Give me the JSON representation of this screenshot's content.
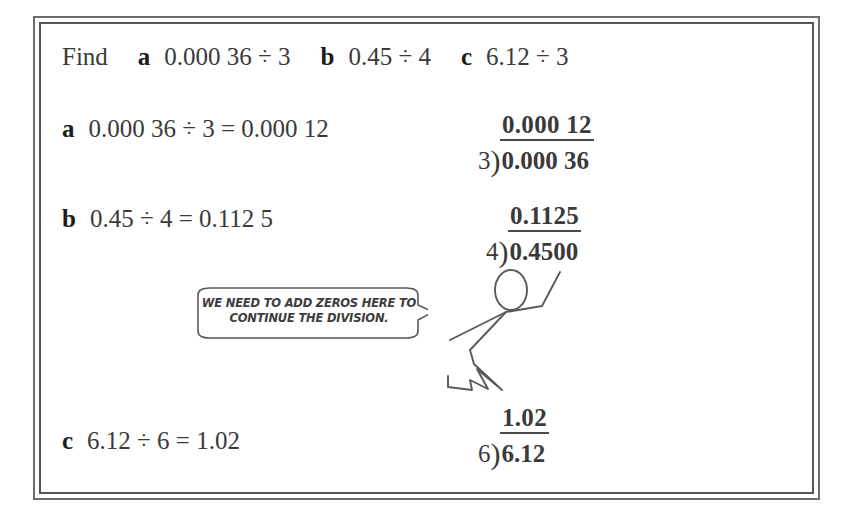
{
  "worksheet": {
    "prompt_label": "Find",
    "questions": [
      {
        "letter": "a",
        "expression": "0.000 36 ÷ 3"
      },
      {
        "letter": "b",
        "expression": "0.45 ÷ 4"
      },
      {
        "letter": "c",
        "expression": "6.12 ÷ 3"
      }
    ],
    "answers": [
      {
        "letter": "a",
        "statement": "0.000 36 ÷ 3 = 0.000 12"
      },
      {
        "letter": "b",
        "statement": "0.45 ÷ 4 = 0.112 5"
      },
      {
        "letter": "c",
        "statement": "6.12 ÷ 6 = 1.02"
      }
    ],
    "long_divisions": [
      {
        "key": "a",
        "quotient": "0.000 12",
        "divisor": "3",
        "dividend": "0.000 36"
      },
      {
        "key": "b",
        "quotient": "0.1125",
        "divisor": "4",
        "dividend": "0.4500"
      },
      {
        "key": "c",
        "quotient": "1.02",
        "divisor": "6",
        "dividend": "6.12"
      }
    ],
    "speech_bubble": {
      "line1": "WE NEED TO ADD ZEROS HERE TO",
      "line2": "CONTINUE THE DIVISION."
    },
    "colors": {
      "ink": "#3a3a3a",
      "bold_ink": "#1c1c1c",
      "frame": "#6d6d6d",
      "sketch": "#5a5a5a"
    }
  }
}
